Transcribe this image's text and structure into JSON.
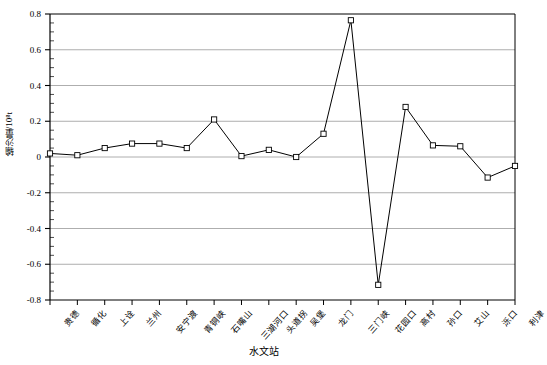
{
  "chart_data": {
    "type": "line",
    "title": "",
    "xlabel": "水文站",
    "ylabel": "输沙量/10⁸t",
    "categories": [
      "贵德",
      "循化",
      "上诠",
      "兰州",
      "安宁渡",
      "青铜峡",
      "石嘴山",
      "三湖河口",
      "头道拐",
      "吴堡",
      "龙门",
      "三门峡",
      "花园口",
      "高村",
      "孙口",
      "艾山",
      "泺口",
      "利津"
    ],
    "values": [
      0.02,
      0.01,
      0.05,
      0.075,
      0.075,
      0.05,
      0.21,
      0.005,
      0.04,
      0.0,
      0.13,
      0.765,
      -0.715,
      0.28,
      0.065,
      0.06,
      -0.115,
      -0.05
    ],
    "ylim": [
      -0.8,
      0.8
    ],
    "ytick_values": [
      "0.8",
      "0.6",
      "0.4",
      "0.2",
      "0",
      "-0.2",
      "-0.4",
      "-0.6",
      "-0.8"
    ],
    "yticks": [
      0.8,
      0.6,
      0.4,
      0.2,
      0,
      -0.2,
      -0.4,
      -0.6,
      -0.8
    ],
    "minor_tick_step": 0.05,
    "grid": true,
    "grid_axis": "y",
    "legend": "none",
    "marker": "open-square",
    "line_color": "#000000",
    "grid_color": "#999999",
    "axis_color": "#000000",
    "marker_fill": "#ffffff"
  }
}
